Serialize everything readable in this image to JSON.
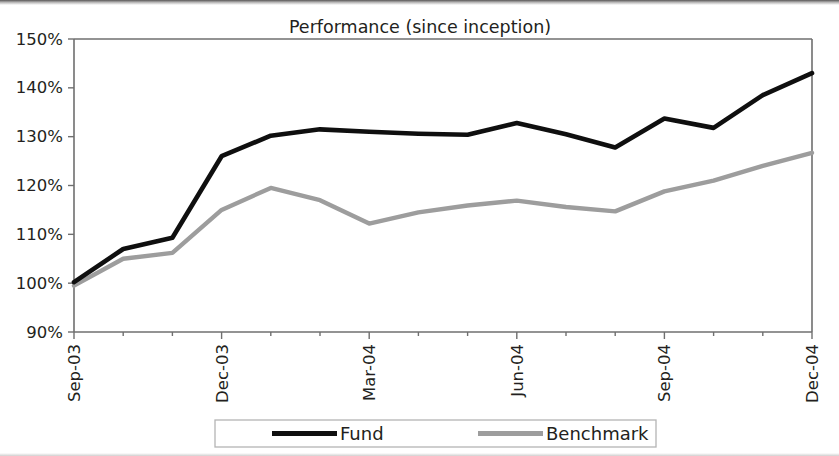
{
  "chart_data": {
    "type": "line",
    "title": "Performance (since inception)",
    "xlabel": "",
    "ylabel": "",
    "ylim": [
      90,
      150
    ],
    "ytick_labels": [
      "90%",
      "100%",
      "110%",
      "120%",
      "130%",
      "140%",
      "150%"
    ],
    "ytick_values": [
      90,
      100,
      110,
      120,
      130,
      140,
      150
    ],
    "grid": false,
    "legend_position": "bottom",
    "x": [
      "Sep-03",
      "Oct-03",
      "Nov-03",
      "Dec-03",
      "Jan-04",
      "Feb-04",
      "Mar-04",
      "Apr-04",
      "May-04",
      "Jun-04",
      "Jul-04",
      "Aug-04",
      "Sep-04",
      "Oct-04",
      "Nov-04",
      "Dec-04"
    ],
    "xtick_labels": [
      "Sep-03",
      "Dec-03",
      "Mar-04",
      "Jun-04",
      "Sep-04",
      "Dec-04"
    ],
    "xtick_indices": [
      0,
      3,
      6,
      9,
      12,
      15
    ],
    "series": [
      {
        "name": "Fund",
        "color": "#0f0f0f",
        "values": [
          100.2,
          107.0,
          109.3,
          126.0,
          130.2,
          131.5,
          131.0,
          130.6,
          130.4,
          132.8,
          130.5,
          127.8,
          133.7,
          131.8,
          138.5,
          143.0
        ]
      },
      {
        "name": "Benchmark",
        "color": "#9d9d9d",
        "values": [
          99.5,
          105.0,
          106.2,
          115.0,
          119.5,
          117.0,
          112.2,
          114.5,
          115.9,
          116.9,
          115.6,
          114.7,
          118.8,
          121.0,
          124.0,
          126.7
        ]
      }
    ]
  },
  "legend": {
    "items": [
      {
        "label": "Fund",
        "color": "#0f0f0f"
      },
      {
        "label": "Benchmark",
        "color": "#9d9d9d"
      }
    ]
  }
}
